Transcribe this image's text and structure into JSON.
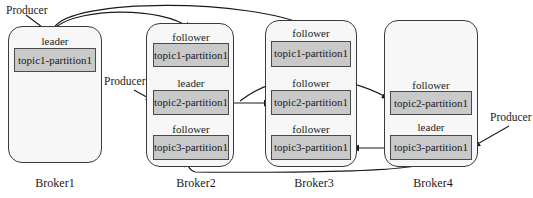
{
  "diagram": {
    "type": "kafka-partition-replication",
    "brokers": [
      {
        "name": "Broker1",
        "partitions": [
          {
            "role": "leader",
            "label": "topic1-partition1"
          }
        ]
      },
      {
        "name": "Broker2",
        "partitions": [
          {
            "role": "follower",
            "label": "topic1-partition1"
          },
          {
            "role": "leader",
            "label": "topic2-partition1"
          },
          {
            "role": "follower",
            "label": "topic3-partition1"
          }
        ]
      },
      {
        "name": "Broker3",
        "partitions": [
          {
            "role": "follower",
            "label": "topic1-partition1"
          },
          {
            "role": "follower",
            "label": "topic2-partition1"
          },
          {
            "role": "follower",
            "label": "topic3-partition1"
          }
        ]
      },
      {
        "name": "Broker4",
        "partitions": [
          {
            "role": "follower",
            "label": "topic2-partition1"
          },
          {
            "role": "leader",
            "label": "topic3-partition1"
          }
        ]
      }
    ],
    "producers": [
      {
        "label": "Producer",
        "target": "Broker1 topic1-partition1"
      },
      {
        "label": "Producer",
        "target": "Broker2 topic2-partition1"
      },
      {
        "label": "Producer",
        "target": "Broker4 topic3-partition1"
      }
    ],
    "replication_edges": [
      {
        "from": "Broker1 topic1-partition1",
        "to": "Broker2 topic1-partition1"
      },
      {
        "from": "Broker1 topic1-partition1",
        "to": "Broker3 topic1-partition1"
      },
      {
        "from": "Broker2 topic2-partition1",
        "to": "Broker3 topic2-partition1"
      },
      {
        "from": "Broker2 topic2-partition1",
        "to": "Broker4 topic2-partition1"
      },
      {
        "from": "Broker4 topic3-partition1",
        "to": "Broker3 topic3-partition1"
      },
      {
        "from": "Broker4 topic3-partition1",
        "to": "Broker2 topic3-partition1"
      }
    ]
  }
}
